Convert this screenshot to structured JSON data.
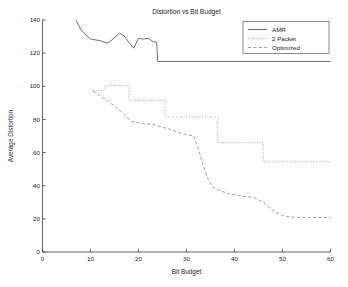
{
  "chart_data": {
    "type": "line",
    "title": "Distortion vs Bit Budget",
    "xlabel": "Bit Budget",
    "ylabel": "Average Distortion",
    "xlim": [
      0,
      60
    ],
    "ylim": [
      0,
      140
    ],
    "xticks": [
      0,
      10,
      20,
      30,
      40,
      50,
      60
    ],
    "yticks": [
      0,
      20,
      40,
      60,
      80,
      100,
      120,
      140
    ],
    "grid": false,
    "legend_position": "top-right",
    "series": [
      {
        "name": "AMR",
        "style": "solid",
        "color": "#4d4d4d",
        "points": [
          [
            7.0,
            140.0
          ],
          [
            8.0,
            134.0
          ],
          [
            10.0,
            128.5
          ],
          [
            12.0,
            127.5
          ],
          [
            13.5,
            126.0
          ],
          [
            14.5,
            128.0
          ],
          [
            16.0,
            132.0
          ],
          [
            17.0,
            130.5
          ],
          [
            18.0,
            126.5
          ],
          [
            19.0,
            123.0
          ],
          [
            20.0,
            129.0
          ],
          [
            21.0,
            128.5
          ],
          [
            22.0,
            129.0
          ],
          [
            23.0,
            127.0
          ],
          [
            23.8,
            126.5
          ],
          [
            24.0,
            115.0
          ],
          [
            60.0,
            115.0
          ]
        ]
      },
      {
        "name": "2 Packet",
        "style": "dotted",
        "color": "#909090",
        "points": [
          [
            10.5,
            97.5
          ],
          [
            13.0,
            97.5
          ],
          [
            13.0,
            100.5
          ],
          [
            18.0,
            100.5
          ],
          [
            18.0,
            91.5
          ],
          [
            25.5,
            91.5
          ],
          [
            25.5,
            81.5
          ],
          [
            36.5,
            81.5
          ],
          [
            36.5,
            66.0
          ],
          [
            46.0,
            66.0
          ],
          [
            46.0,
            54.5
          ],
          [
            60.0,
            54.5
          ]
        ]
      },
      {
        "name": "Optimized",
        "style": "dashed",
        "color": "#8a8a8a",
        "points": [
          [
            10.5,
            97.0
          ],
          [
            13.0,
            92.5
          ],
          [
            15.0,
            88.0
          ],
          [
            17.0,
            83.0
          ],
          [
            18.5,
            79.0
          ],
          [
            20.0,
            78.0
          ],
          [
            23.0,
            77.0
          ],
          [
            26.0,
            74.5
          ],
          [
            28.5,
            72.0
          ],
          [
            30.5,
            70.5
          ],
          [
            31.5,
            70.0
          ],
          [
            32.5,
            62.0
          ],
          [
            33.5,
            52.0
          ],
          [
            34.5,
            44.0
          ],
          [
            35.5,
            39.0
          ],
          [
            37.0,
            37.0
          ],
          [
            39.0,
            35.0
          ],
          [
            42.0,
            33.5
          ],
          [
            44.0,
            33.0
          ],
          [
            46.0,
            30.0
          ],
          [
            48.0,
            25.0
          ],
          [
            50.0,
            22.0
          ],
          [
            52.0,
            21.0
          ],
          [
            56.0,
            20.8
          ],
          [
            60.0,
            20.8
          ]
        ]
      }
    ]
  },
  "legend": {
    "items": [
      {
        "label": "AMR"
      },
      {
        "label": "2 Packet"
      },
      {
        "label": "Optimized"
      }
    ]
  }
}
